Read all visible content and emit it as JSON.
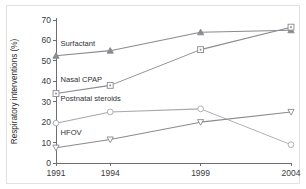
{
  "chart_data": {
    "type": "line",
    "title": "",
    "xlabel": "",
    "ylabel": "Respiratory interventions (%)",
    "x": [
      1991,
      1994,
      1999,
      2004
    ],
    "xtick_labels": [
      "1991",
      "1994",
      "1999",
      "2004"
    ],
    "ytick_labels": [
      "0",
      "10",
      "20",
      "30",
      "40",
      "50",
      "60",
      "70"
    ],
    "ytick_values": [
      0,
      10,
      20,
      30,
      40,
      50,
      60,
      70
    ],
    "ylim": [
      0,
      70
    ],
    "xlim": [
      1991,
      2004
    ],
    "grid": false,
    "legend_position": "inline-labels",
    "series": [
      {
        "name": "Surfactant",
        "values": [
          52.5,
          55,
          64,
          65
        ],
        "marker": "triangle-up-filled",
        "color": "#8a8a90",
        "label_x": 1991.25,
        "label_y": 57.5
      },
      {
        "name": "Nasal CPAP",
        "values": [
          34,
          38,
          55.5,
          66.5
        ],
        "marker": "square-dot",
        "color": "#8a8a90",
        "label_x": 1991.25,
        "label_y": 39.5
      },
      {
        "name": "Postnatal steroids",
        "values": [
          19.5,
          25,
          26.5,
          9
        ],
        "marker": "circle-open",
        "color": "#a8a8ad",
        "label_x": 1991.25,
        "label_y": 30.5
      },
      {
        "name": "HFOV",
        "values": [
          7.5,
          11.5,
          20,
          25
        ],
        "marker": "triangle-down-open",
        "color": "#8a8a90",
        "label_x": 1991.25,
        "label_y": 13.5
      }
    ]
  },
  "colors": {
    "axis": "#6e6e72",
    "text": "#2f2f33",
    "border": "#e2e2e2",
    "background": "#ffffff"
  }
}
